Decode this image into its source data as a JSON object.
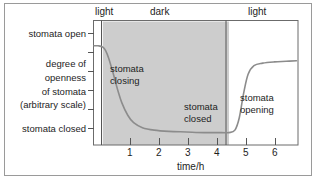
{
  "chart_data": {
    "type": "line",
    "title": "",
    "xlabel": "time/h",
    "ylabel": "degree of openness of stomata (arbitrary scale)",
    "ylabel_lines": [
      "degree of",
      "openness",
      "of stomata",
      "(arbitrary scale)"
    ],
    "y_top_label": "stomata open",
    "y_bottom_label": "stomata closed",
    "xlim": [
      -0.35,
      6.6
    ],
    "ylim": [
      0,
      1
    ],
    "xticks": [
      1,
      2,
      3,
      4,
      5,
      6
    ],
    "xtick_labels": [
      "1",
      "2",
      "3",
      "4",
      "5",
      "6"
    ],
    "ytick_count": 6,
    "grid": false,
    "legend": "none",
    "series": [
      {
        "name": "degree of openness of stomata",
        "color": "#8c8c8c",
        "x": [
          -0.35,
          -0.2,
          -0.05,
          0.05,
          0.15,
          0.3,
          0.45,
          0.6,
          0.8,
          1.0,
          1.3,
          1.7,
          2.2,
          2.8,
          3.4,
          4.0,
          4.25,
          4.45,
          4.6,
          4.75,
          4.9,
          5.1,
          5.4,
          5.8,
          6.2,
          6.55
        ],
        "y": [
          0.8,
          0.8,
          0.79,
          0.76,
          0.7,
          0.58,
          0.45,
          0.34,
          0.24,
          0.18,
          0.14,
          0.12,
          0.11,
          0.105,
          0.1,
          0.1,
          0.1,
          0.12,
          0.22,
          0.42,
          0.57,
          0.64,
          0.66,
          0.67,
          0.675,
          0.68
        ]
      }
    ],
    "phases": [
      {
        "label": "light",
        "x_start": -0.35,
        "x_end": -0.05,
        "shade": "none"
      },
      {
        "label": "dark",
        "x_start": -0.05,
        "x_end": 4.25,
        "shade": "#cdcdcd"
      },
      {
        "label": "light",
        "x_start": 4.25,
        "x_end": 6.6,
        "shade": "none"
      }
    ],
    "annotations": [
      {
        "id": "stomata-closing",
        "lines": [
          "stomata",
          "closing"
        ],
        "x": 0.55,
        "y": 0.6
      },
      {
        "id": "stomata-closed",
        "lines": [
          "stomata",
          "closed"
        ],
        "x": 3.05,
        "y": 0.22
      },
      {
        "id": "stomata-opening",
        "lines": [
          "stomata",
          "opening"
        ],
        "x": 4.75,
        "y": 0.33
      }
    ],
    "colors": {
      "curve": "#8c8c8c",
      "dark_band": "#cdcdcd",
      "axis": "#555555",
      "frame": "#6b6b6b",
      "outer_border": "#9a9a9a",
      "text": "#1d1d1d",
      "background": "#ffffff"
    }
  },
  "phase_labels": {
    "left_light": "light",
    "dark": "dark",
    "right_light": "light"
  },
  "axis": {
    "x_title": "time/h",
    "x_ticks": [
      "1",
      "2",
      "3",
      "4",
      "5",
      "6"
    ],
    "y_top": "stomata open",
    "y_bottom": "stomata closed",
    "y_title_l1": "degree of",
    "y_title_l2": "openness",
    "y_title_l3": "of stomata",
    "y_title_l4": "(arbitrary scale)"
  },
  "annotations": {
    "closing_l1": "stomata",
    "closing_l2": "closing",
    "closed_l1": "stomata",
    "closed_l2": "closed",
    "opening_l1": "stomata",
    "opening_l2": "opening"
  }
}
